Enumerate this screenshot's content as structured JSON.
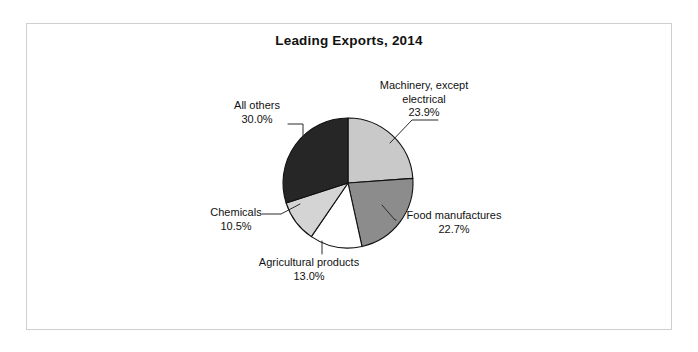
{
  "figure": {
    "title": "Leading Exports, 2014",
    "frame_color": "#cfcfcf",
    "background": "#ffffff"
  },
  "chart_data": {
    "type": "pie",
    "title": "Leading Exports, 2014",
    "xlabel": "",
    "ylabel": "",
    "units": "percent",
    "start_angle_deg": 0,
    "direction": "clockwise",
    "legend": "none (direct labels with leader lines)",
    "grid": false,
    "categories": [
      "Machinery, except electrical",
      "Food manufactures",
      "Agricultural products",
      "Chemicals",
      "All others"
    ],
    "values": [
      23.9,
      22.7,
      13.0,
      10.5,
      30.0
    ],
    "value_labels": [
      "23.9%",
      "22.7%",
      "13.0%",
      "10.5%",
      "30.0%"
    ],
    "colors": [
      "#c9c9c9",
      "#8c8c8c",
      "#ffffff",
      "#d4d4d4",
      "#262626"
    ],
    "slices": [
      {
        "name": "Machinery, except electrical",
        "label_line1": "Machinery, except",
        "label_line2": "electrical",
        "value": 23.9,
        "value_label": "23.9%",
        "color": "#c9c9c9"
      },
      {
        "name": "Food manufactures",
        "label_line1": "Food manufactures",
        "label_line2": "",
        "value": 22.7,
        "value_label": "22.7%",
        "color": "#8c8c8c"
      },
      {
        "name": "Agricultural products",
        "label_line1": "Agricultural products",
        "label_line2": "",
        "value": 13.0,
        "value_label": "13.0%",
        "color": "#ffffff"
      },
      {
        "name": "Chemicals",
        "label_line1": "Chemicals",
        "label_line2": "",
        "value": 10.5,
        "value_label": "10.5%",
        "color": "#d4d4d4"
      },
      {
        "name": "All others",
        "label_line1": "All others",
        "label_line2": "",
        "value": 30.0,
        "value_label": "30.0%",
        "color": "#262626"
      }
    ],
    "geometry": {
      "center_x": 348,
      "center_y": 183,
      "radius": 65
    }
  }
}
